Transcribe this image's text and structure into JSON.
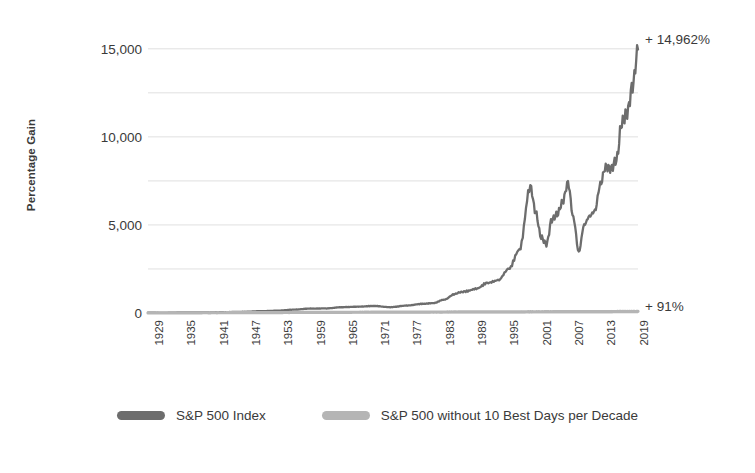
{
  "chart_data": {
    "type": "line",
    "title": "",
    "xlabel": "",
    "ylabel": "Percentage Gain",
    "xlim": [
      1929,
      2020
    ],
    "ylim": [
      0,
      15500
    ],
    "yticks": [
      0,
      5000,
      10000,
      15000
    ],
    "ytick_labels": [
      "0",
      "5,000",
      "10,000",
      "15,000"
    ],
    "y_minor_gridlines": [
      2500,
      7500,
      12500
    ],
    "grid": true,
    "legend_position": "bottom",
    "xticks": [
      1929,
      1935,
      1941,
      1947,
      1953,
      1959,
      1965,
      1971,
      1977,
      1983,
      1989,
      1995,
      2001,
      2007,
      2013,
      2019
    ],
    "xtick_labels": [
      "1929",
      "1935",
      "1941",
      "1947",
      "1953",
      "1959",
      "1965",
      "1971",
      "1977",
      "1983",
      "1989",
      "1995",
      "2001",
      "2007",
      "2013",
      "2019"
    ],
    "series": [
      {
        "name": "S&P 500 Index",
        "color": "#6d6d6d",
        "end_label": "+ 14,962%",
        "x": [
          1929,
          1932,
          1935,
          1938,
          1941,
          1944,
          1947,
          1950,
          1953,
          1956,
          1959,
          1962,
          1965,
          1968,
          1971,
          1974,
          1977,
          1980,
          1982,
          1984,
          1986,
          1987,
          1988,
          1990,
          1992,
          1994,
          1996,
          1998,
          2000,
          2001,
          2002,
          2003,
          2004,
          2005,
          2006,
          2007,
          2008,
          2009,
          2010,
          2011,
          2012,
          2013,
          2014,
          2015,
          2016,
          2017,
          2018,
          2019,
          2020
        ],
        "y": [
          20,
          8,
          30,
          35,
          40,
          55,
          70,
          105,
          130,
          190,
          250,
          260,
          330,
          360,
          400,
          330,
          420,
          520,
          560,
          760,
          1080,
          1180,
          1230,
          1380,
          1700,
          1850,
          2500,
          3600,
          7200,
          5700,
          4300,
          3900,
          5300,
          5600,
          6300,
          7400,
          5400,
          3450,
          5000,
          5500,
          5800,
          7300,
          8300,
          8200,
          8700,
          10800,
          11400,
          12900,
          14962
        ]
      },
      {
        "name": "S&P 500 without 10 Best Days per Decade",
        "color": "#b5b5b5",
        "end_label": "+ 91%",
        "x": [
          1929,
          1935,
          1941,
          1947,
          1953,
          1959,
          1965,
          1971,
          1977,
          1983,
          1989,
          1995,
          2001,
          2007,
          2013,
          2019,
          2020
        ],
        "y": [
          5,
          10,
          14,
          20,
          26,
          34,
          40,
          46,
          50,
          56,
          62,
          66,
          72,
          78,
          82,
          88,
          91
        ]
      }
    ],
    "annotations": [
      {
        "text": "+ 14,962%",
        "value": 14962,
        "series": "S&P 500 Index"
      },
      {
        "text": "+ 91%",
        "value": 91,
        "series": "S&P 500 without 10 Best Days per Decade"
      }
    ]
  },
  "axis": {
    "y_title": "Percentage Gain"
  },
  "legend": {
    "items": [
      {
        "label": "S&P 500 Index",
        "color": "#6d6d6d"
      },
      {
        "label": "S&P 500 without 10 Best Days per Decade",
        "color": "#b5b5b5"
      }
    ]
  },
  "colors": {
    "primary_series": "#6d6d6d",
    "secondary_series": "#b5b5b5",
    "gridline": "#d8d8d8",
    "text": "#3a3a3a",
    "background": "#ffffff"
  }
}
